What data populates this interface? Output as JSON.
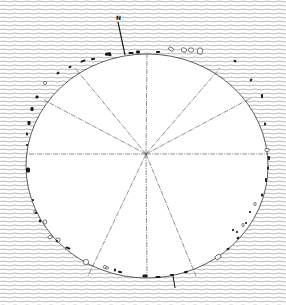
{
  "diagram": {
    "north_label": "N",
    "colors": {
      "background_hatch": "#8a8a8a",
      "paper": "#ffffff",
      "ink": "#1a1a1a",
      "lines": "#444444"
    },
    "circle": {
      "cx": 147,
      "cy": 166,
      "rx": 121,
      "ry": 112
    },
    "center": {
      "x": 146,
      "y": 154
    },
    "north_arrow": {
      "x1": 125,
      "y1": 55,
      "x2": 118,
      "y2": 22
    },
    "radial_lines": [
      {
        "name": "line-to-north",
        "x2": 147,
        "y2": 54
      },
      {
        "name": "line-to-south",
        "x2": 147,
        "y2": 278
      },
      {
        "name": "line-to-west",
        "x2": 26,
        "y2": 154
      },
      {
        "name": "line-to-east",
        "x2": 268,
        "y2": 154
      },
      {
        "name": "line-to-nw-steep",
        "x2": 75,
        "y2": 68
      },
      {
        "name": "line-to-ne-steep",
        "x2": 220,
        "y2": 68
      },
      {
        "name": "line-to-nw-shallow",
        "x2": 44,
        "y2": 100
      },
      {
        "name": "line-to-ne-shallow",
        "x2": 251,
        "y2": 98
      },
      {
        "name": "line-to-sw",
        "x2": 88,
        "y2": 276
      },
      {
        "name": "line-to-se",
        "x2": 196,
        "y2": 276
      }
    ],
    "stones": [
      {
        "x": 108,
        "y": 54,
        "w": 6,
        "h": 3,
        "r": -10,
        "fill": "solid"
      },
      {
        "x": 131,
        "y": 53,
        "w": 5,
        "h": 2,
        "r": 0,
        "fill": "solid"
      },
      {
        "x": 138,
        "y": 52,
        "w": 4,
        "h": 3,
        "r": 0,
        "fill": "solid"
      },
      {
        "x": 158,
        "y": 52,
        "w": 4,
        "h": 2,
        "r": 0,
        "fill": "solid"
      },
      {
        "x": 171,
        "y": 49,
        "w": 5,
        "h": 3,
        "r": 30,
        "fill": "open"
      },
      {
        "x": 184,
        "y": 50,
        "w": 5,
        "h": 4,
        "r": 20,
        "fill": "open"
      },
      {
        "x": 191,
        "y": 50,
        "w": 5,
        "h": 4,
        "r": 0,
        "fill": "open"
      },
      {
        "x": 200,
        "y": 51,
        "w": 5,
        "h": 6,
        "r": 10,
        "fill": "open"
      },
      {
        "x": 83,
        "y": 61,
        "w": 5,
        "h": 2,
        "r": -20,
        "fill": "solid"
      },
      {
        "x": 93,
        "y": 59,
        "w": 4,
        "h": 2,
        "r": -15,
        "fill": "solid"
      },
      {
        "x": 110,
        "y": 55,
        "w": 3,
        "h": 2,
        "r": 0,
        "fill": "solid"
      },
      {
        "x": 70,
        "y": 67,
        "w": 3,
        "h": 2,
        "r": -30,
        "fill": "solid"
      },
      {
        "x": 58,
        "y": 73,
        "w": 3,
        "h": 2,
        "r": -35,
        "fill": "solid"
      },
      {
        "x": 45,
        "y": 83,
        "w": 3,
        "h": 3,
        "r": 0,
        "fill": "open"
      },
      {
        "x": 37,
        "y": 97,
        "w": 3,
        "h": 3,
        "r": 0,
        "fill": "solid"
      },
      {
        "x": 32,
        "y": 109,
        "w": 3,
        "h": 4,
        "r": 0,
        "fill": "solid"
      },
      {
        "x": 29,
        "y": 123,
        "w": 3,
        "h": 4,
        "r": 0,
        "fill": "solid"
      },
      {
        "x": 27,
        "y": 134,
        "w": 2,
        "h": 3,
        "r": 0,
        "fill": "solid"
      },
      {
        "x": 27,
        "y": 145,
        "w": 2,
        "h": 2,
        "r": 0,
        "fill": "solid"
      },
      {
        "x": 28,
        "y": 170,
        "w": 4,
        "h": 5,
        "r": 0,
        "fill": "solid"
      },
      {
        "x": 33,
        "y": 200,
        "w": 2,
        "h": 2,
        "r": 0,
        "fill": "solid"
      },
      {
        "x": 35,
        "y": 212,
        "w": 2,
        "h": 3,
        "r": 0,
        "fill": "open"
      },
      {
        "x": 36,
        "y": 213,
        "w": 2,
        "h": 2,
        "r": 0,
        "fill": "solid"
      },
      {
        "x": 235,
        "y": 61,
        "w": 3,
        "h": 2,
        "r": 30,
        "fill": "solid"
      },
      {
        "x": 251,
        "y": 80,
        "w": 2,
        "h": 3,
        "r": 40,
        "fill": "solid"
      },
      {
        "x": 262,
        "y": 96,
        "w": 2,
        "h": 4,
        "r": 0,
        "fill": "solid"
      },
      {
        "x": 265,
        "y": 124,
        "w": 2,
        "h": 3,
        "r": 0,
        "fill": "solid"
      },
      {
        "x": 267,
        "y": 150,
        "w": 4,
        "h": 3,
        "r": 0,
        "fill": "open"
      },
      {
        "x": 269,
        "y": 158,
        "w": 2,
        "h": 4,
        "r": 0,
        "fill": "solid"
      },
      {
        "x": 268,
        "y": 168,
        "w": 2,
        "h": 3,
        "r": 0,
        "fill": "solid"
      },
      {
        "x": 266,
        "y": 180,
        "w": 2,
        "h": 4,
        "r": 0,
        "fill": "solid"
      },
      {
        "x": 262,
        "y": 195,
        "w": 2,
        "h": 3,
        "r": 0,
        "fill": "solid"
      },
      {
        "x": 255,
        "y": 204,
        "w": 2,
        "h": 3,
        "r": 0,
        "fill": "open"
      },
      {
        "x": 250,
        "y": 212,
        "w": 2,
        "h": 2,
        "r": 0,
        "fill": "solid"
      },
      {
        "x": 243,
        "y": 225,
        "w": 2,
        "h": 3,
        "r": 0,
        "fill": "open"
      },
      {
        "x": 237,
        "y": 232,
        "w": 2,
        "h": 2,
        "r": 0,
        "fill": "solid"
      },
      {
        "x": 233,
        "y": 230,
        "w": 2,
        "h": 2,
        "r": 40,
        "fill": "solid"
      },
      {
        "x": 40,
        "y": 221,
        "w": 2,
        "h": 3,
        "r": 0,
        "fill": "solid"
      },
      {
        "x": 45,
        "y": 222,
        "w": 3,
        "h": 4,
        "r": 0,
        "fill": "open"
      },
      {
        "x": 50,
        "y": 237,
        "w": 4,
        "h": 3,
        "r": -30,
        "fill": "open"
      },
      {
        "x": 58,
        "y": 240,
        "w": 4,
        "h": 4,
        "r": 0,
        "fill": "open"
      },
      {
        "x": 57,
        "y": 241,
        "w": 2,
        "h": 2,
        "r": 0,
        "fill": "solid"
      },
      {
        "x": 68,
        "y": 248,
        "w": 5,
        "h": 2,
        "r": 20,
        "fill": "solid"
      },
      {
        "x": 86,
        "y": 262,
        "w": 5,
        "h": 5,
        "r": 0,
        "fill": "open"
      },
      {
        "x": 105,
        "y": 267,
        "w": 3,
        "h": 3,
        "r": 0,
        "fill": "open"
      },
      {
        "x": 115,
        "y": 270,
        "w": 2,
        "h": 3,
        "r": 0,
        "fill": "solid"
      },
      {
        "x": 107,
        "y": 268,
        "w": 3,
        "h": 2,
        "r": 0,
        "fill": "open"
      },
      {
        "x": 120,
        "y": 272,
        "w": 4,
        "h": 2,
        "r": 10,
        "fill": "solid"
      },
      {
        "x": 145,
        "y": 276,
        "w": 5,
        "h": 3,
        "r": 0,
        "fill": "solid"
      },
      {
        "x": 158,
        "y": 277,
        "w": 5,
        "h": 2,
        "r": 0,
        "fill": "solid"
      },
      {
        "x": 172,
        "y": 275,
        "w": 4,
        "h": 2,
        "r": 0,
        "fill": "solid"
      },
      {
        "x": 186,
        "y": 272,
        "w": 4,
        "h": 2,
        "r": -10,
        "fill": "solid"
      },
      {
        "x": 218,
        "y": 257,
        "w": 6,
        "h": 4,
        "r": -30,
        "fill": "open"
      },
      {
        "x": 228,
        "y": 249,
        "w": 3,
        "h": 2,
        "r": -30,
        "fill": "solid"
      },
      {
        "x": 238,
        "y": 238,
        "w": 3,
        "h": 2,
        "r": -40,
        "fill": "solid"
      },
      {
        "x": 246,
        "y": 223,
        "w": 2,
        "h": 2,
        "r": 0,
        "fill": "solid"
      }
    ],
    "outlier_stone_south": {
      "x1": 173,
      "y1": 276,
      "x2": 175,
      "y2": 288
    }
  }
}
